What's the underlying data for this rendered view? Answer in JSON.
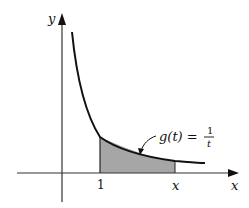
{
  "diagram": {
    "type": "function-graph-area",
    "function_label": {
      "lhs": "g(t) =",
      "numerator": "1",
      "denominator": "t"
    },
    "axes": {
      "x_label": "x",
      "y_label": "y"
    },
    "ticks": {
      "lower_bound_label": "1",
      "upper_bound_label": "x"
    },
    "shaded_region": {
      "description": "area under g(t)=1/t from t=1 to t=x",
      "fill_color": "#a6a6a6"
    },
    "colors": {
      "curve": "#111111",
      "axes": "#333333",
      "background": "#ffffff"
    }
  }
}
